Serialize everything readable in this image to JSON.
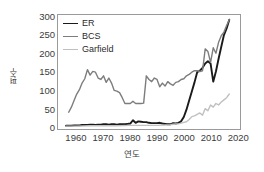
{
  "chart_data": {
    "type": "line",
    "title": "",
    "xlabel": "연도",
    "ylabel": "편수",
    "xlim": [
      1953,
      2021
    ],
    "ylim": [
      -8,
      305
    ],
    "xticks": [
      "1960",
      "1970",
      "1980",
      "1990",
      "2000",
      "2010",
      "2020"
    ],
    "xtick_values": [
      1960,
      1970,
      1980,
      1990,
      2000,
      2010,
      2020
    ],
    "yticks": [
      "0",
      "50",
      "100",
      "150",
      "200",
      "250",
      "300"
    ],
    "ytick_values": [
      0,
      50,
      100,
      150,
      200,
      250,
      300
    ],
    "grid": false,
    "legend_position": "top-left",
    "legend_entries": [
      "ER",
      "BCS",
      "Garfield"
    ],
    "series": [
      {
        "name": "ER",
        "color": "#1a1a1a",
        "width": 1.9,
        "x": [
          1956,
          1957,
          1958,
          1959,
          1960,
          1961,
          1962,
          1963,
          1964,
          1965,
          1966,
          1967,
          1968,
          1969,
          1970,
          1971,
          1972,
          1973,
          1974,
          1975,
          1976,
          1977,
          1978,
          1979,
          1980,
          1981,
          1982,
          1983,
          1984,
          1985,
          1986,
          1987,
          1988,
          1989,
          1990,
          1991,
          1992,
          1993,
          1994,
          1995,
          1996,
          1997,
          1998,
          1999,
          2000,
          2001,
          2002,
          2003,
          2004,
          2005,
          2006,
          2007,
          2008,
          2009,
          2010,
          2011,
          2012,
          2013,
          2014,
          2015,
          2016,
          2017
        ],
        "values": [
          1,
          1,
          1,
          2,
          2,
          2,
          3,
          3,
          3,
          4,
          4,
          3,
          4,
          4,
          5,
          5,
          4,
          5,
          5,
          4,
          5,
          5,
          5,
          6,
          7,
          16,
          9,
          13,
          12,
          11,
          11,
          9,
          8,
          8,
          8,
          9,
          7,
          6,
          5,
          5,
          8,
          7,
          9,
          13,
          25,
          45,
          70,
          95,
          120,
          148,
          152,
          160,
          172,
          178,
          172,
          122,
          150,
          185,
          218,
          250,
          268,
          292
        ]
      },
      {
        "name": "BCS",
        "color": "#7d7d7d",
        "width": 1.4,
        "x": [
          1957,
          1958,
          1959,
          1960,
          1961,
          1962,
          1963,
          1964,
          1965,
          1966,
          1967,
          1968,
          1969,
          1970,
          1971,
          1972,
          1973,
          1974,
          1975,
          1976,
          1977,
          1978,
          1979,
          1980,
          1981,
          1982,
          1983,
          1984,
          1985,
          1986,
          1987,
          1988,
          1989,
          1990,
          1991,
          1992,
          1993,
          1994,
          1995,
          1996,
          1997,
          1998,
          1999,
          2000,
          2001,
          2002,
          2003,
          2004,
          2005,
          2006,
          2007,
          2008,
          2009,
          2010,
          2011,
          2012,
          2013,
          2014,
          2015,
          2016,
          2017
        ],
        "values": [
          38,
          52,
          70,
          88,
          100,
          118,
          130,
          155,
          140,
          150,
          148,
          132,
          128,
          138,
          120,
          132,
          118,
          98,
          96,
          92,
          78,
          62,
          62,
          62,
          68,
          62,
          62,
          62,
          63,
          138,
          128,
          122,
          132,
          128,
          108,
          118,
          110,
          122,
          116,
          112,
          120,
          122,
          128,
          130,
          138,
          142,
          148,
          152,
          152,
          150,
          152,
          212,
          205,
          175,
          215,
          200,
          230,
          248,
          258,
          276,
          292
        ]
      },
      {
        "name": "Garfield",
        "color": "#c0c0c0",
        "width": 1.4,
        "x": [
          1956,
          1960,
          1965,
          1970,
          1975,
          1980,
          1985,
          1990,
          1993,
          1995,
          1996,
          1997,
          1998,
          1999,
          2000,
          2001,
          2002,
          2003,
          2004,
          2005,
          2006,
          2007,
          2008,
          2009,
          2010,
          2011,
          2012,
          2013,
          2014,
          2015,
          2016,
          2017
        ],
        "values": [
          0,
          0,
          1,
          1,
          1,
          2,
          2,
          2,
          3,
          4,
          5,
          6,
          6,
          8,
          10,
          12,
          18,
          26,
          28,
          32,
          36,
          30,
          48,
          42,
          58,
          52,
          62,
          58,
          66,
          72,
          78,
          88
        ]
      }
    ]
  }
}
